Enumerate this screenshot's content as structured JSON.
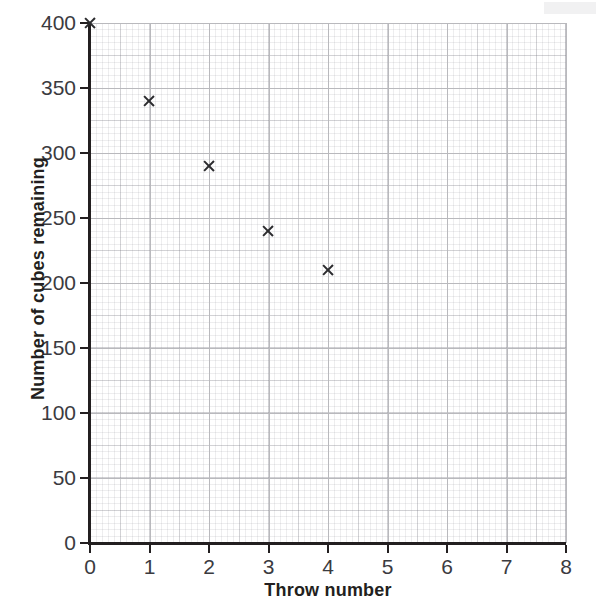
{
  "chart_data": {
    "type": "scatter",
    "title": "",
    "xlabel": "Throw number",
    "ylabel": "Number of cubes remaining",
    "xlim": [
      0,
      8
    ],
    "ylim": [
      0,
      400
    ],
    "xticks": [
      0,
      1,
      2,
      3,
      4,
      5,
      6,
      7,
      8
    ],
    "xticklabels": [
      "0",
      "1",
      "2",
      "3",
      "4",
      "5",
      "6",
      "7",
      "8"
    ],
    "yticks": [
      0,
      50,
      100,
      150,
      200,
      250,
      300,
      350,
      400
    ],
    "yticklabels": [
      "0",
      "50",
      "100",
      "150",
      "200",
      "250",
      "300",
      "350",
      "400"
    ],
    "grid": true,
    "grid_style": "graph-paper-minor-and-major",
    "legend": "none",
    "marker": "x",
    "marker_color": "#2b2b2e",
    "x": [
      0,
      1,
      2,
      3,
      4
    ],
    "y": [
      400,
      340,
      290,
      240,
      210
    ],
    "points": [
      {
        "x": 0,
        "y": 400
      },
      {
        "x": 1,
        "y": 340
      },
      {
        "x": 2,
        "y": 290
      },
      {
        "x": 3,
        "y": 240
      },
      {
        "x": 4,
        "y": 210
      }
    ],
    "axis_color": "#231f20",
    "gridline_color": "#b9b9bd",
    "background_color": "#ffffff"
  }
}
